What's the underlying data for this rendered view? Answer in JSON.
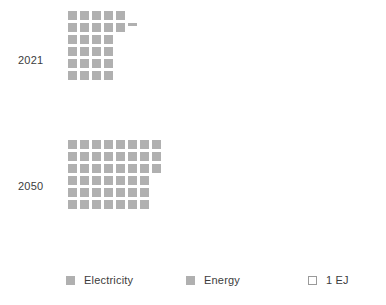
{
  "chart_data": {
    "type": "bar",
    "chart_style": "waffle",
    "title": "",
    "subtitle": "",
    "xlabel": "",
    "ylabel": "",
    "unit": "EJ",
    "unit_note": "1 EJ",
    "cell_value": 1,
    "categories": [
      "2021",
      "2050"
    ],
    "series": [
      {
        "name": "Electricity",
        "values": [
          29,
          47
        ],
        "color": "#b0b0b0"
      },
      {
        "name": "Energy",
        "values": [
          29,
          47
        ],
        "color": "#b0b0b0"
      }
    ],
    "groups": [
      {
        "label": "2021",
        "total": 29.3,
        "full_cells": 29,
        "partial_cell": 0.3,
        "rows": [
          5,
          5,
          4,
          4,
          4,
          4
        ],
        "columns": 5
      },
      {
        "label": "2050",
        "total": 47,
        "full_cells": 47,
        "partial_cell": 0,
        "rows": [
          8,
          8,
          8,
          7,
          7,
          7
        ],
        "columns": 8
      }
    ],
    "legend_position": "bottom",
    "grid": false
  },
  "labels": {
    "year_2021": "2021",
    "year_2050": "2050"
  },
  "legend": {
    "items": [
      {
        "label": "Electricity",
        "swatch": "filled"
      },
      {
        "label": "Energy",
        "swatch": "filled"
      },
      {
        "label": "1 EJ",
        "swatch": "outline"
      }
    ]
  },
  "colors": {
    "cell": "#b0b0b0",
    "text": "#3c3c3c",
    "outline": "#9a9a9a",
    "background": "#ffffff"
  }
}
